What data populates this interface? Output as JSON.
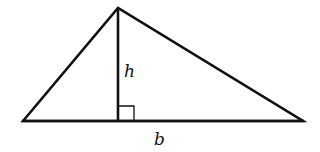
{
  "diagram": {
    "type": "triangle-area",
    "stroke_color": "#111111",
    "background": "#ffffff",
    "vertices": {
      "apex": [
        118,
        8
      ],
      "base_left": [
        23,
        121
      ],
      "base_right": [
        303,
        121
      ]
    },
    "altitude_foot": [
      118,
      121
    ],
    "right_angle_marker": {
      "x": 118,
      "y": 106,
      "size": 15
    },
    "labels": {
      "height": "h",
      "base": "b"
    }
  }
}
